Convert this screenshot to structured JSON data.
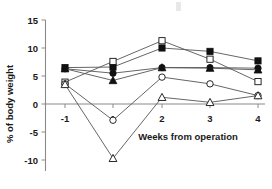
{
  "chart_data": {
    "type": "line",
    "title": "",
    "xlabel": "Weeks from operation",
    "ylabel": "% of body weight",
    "x": [
      -1,
      1,
      2,
      3,
      4
    ],
    "xtick_labels": [
      "-1",
      "1",
      "2",
      "3",
      "4"
    ],
    "ytick_labels": [
      "15",
      "10",
      "5",
      "0",
      "-5",
      "-10"
    ],
    "yticks": [
      15,
      10,
      5,
      0,
      -5,
      -10
    ],
    "ylim": [
      -11,
      15
    ],
    "xlim": [
      -1.7,
      4.7
    ],
    "grid": false,
    "legend": "none",
    "zero_reference_line": true,
    "series": [
      {
        "name": "Filled square",
        "marker": "filled-square",
        "values": [
          6.5,
          6.6,
          10.0,
          9.4,
          7.7
        ]
      },
      {
        "name": "Open square",
        "marker": "open-square",
        "values": [
          3.9,
          7.6,
          11.3,
          8.0,
          4.0
        ]
      },
      {
        "name": "Filled circle",
        "marker": "filled-circle",
        "values": [
          6.3,
          5.5,
          6.5,
          6.5,
          6.4
        ]
      },
      {
        "name": "Open circle",
        "marker": "open-circle",
        "values": [
          3.6,
          -2.9,
          4.8,
          3.6,
          1.5
        ]
      },
      {
        "name": "Filled triangle",
        "marker": "filled-triangle",
        "values": [
          6.3,
          4.2,
          6.5,
          6.4,
          6.1
        ]
      },
      {
        "name": "Open triangle",
        "marker": "open-triangle",
        "values": [
          3.5,
          -9.7,
          1.2,
          0.3,
          1.5
        ]
      }
    ]
  },
  "axis": {
    "y_title": "% of body weight",
    "x_title": "Weeks from operation",
    "y_tick_0": "15",
    "y_tick_1": "10",
    "y_tick_2": "5",
    "y_tick_3": "0",
    "y_tick_4": "-5",
    "y_tick_5": "-10",
    "x_tick_0": "-1",
    "x_tick_1": "1",
    "x_tick_2": "2",
    "x_tick_3": "3",
    "x_tick_4": "4"
  }
}
